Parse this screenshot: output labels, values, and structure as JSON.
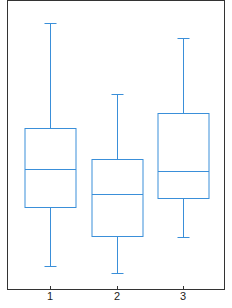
{
  "chart_data": {
    "type": "box",
    "title": "",
    "xlabel": "",
    "ylabel": "",
    "categories": [
      "1",
      "2",
      "3"
    ],
    "grid": false,
    "legend": null,
    "units_note": "Values are relative plot heights (no y-axis labels shown)",
    "ylim": [
      0,
      290
    ],
    "boxes": [
      {
        "label": "1",
        "whisker_high": 267,
        "q3": 162,
        "median": 121,
        "q1": 83,
        "whisker_low": 24
      },
      {
        "label": "2",
        "whisker_high": 196,
        "q3": 131,
        "median": 96,
        "q1": 54,
        "whisker_low": 17
      },
      {
        "label": "3",
        "whisker_high": 252,
        "q3": 177,
        "median": 119,
        "q1": 92,
        "whisker_low": 53
      }
    ],
    "colors": {
      "box": "#3a8fd9",
      "frame": "#333333"
    }
  }
}
